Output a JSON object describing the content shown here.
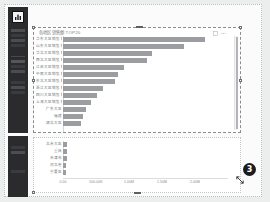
{
  "app": {
    "logo_icon": "bar-chart-logo-icon",
    "sidebar": {
      "items": [
        {
          "icon": "grid-menu-icon"
        },
        {
          "icon": "grid-menu-icon"
        },
        {
          "icon": "list-menu-icon"
        },
        {
          "icon": "list-menu-icon"
        },
        {
          "icon": "settings-menu-icon"
        },
        {
          "icon": "settings-menu-icon"
        }
      ]
    }
  },
  "panels": {
    "top": {
      "title": "各地区销售额 TOP20",
      "selected": true,
      "tools": [
        {
          "icon": "expand-icon"
        },
        {
          "icon": "more-options-icon"
        }
      ],
      "scrollbar": {
        "icon": "vertical-scrollbar"
      }
    },
    "bottom": {
      "annotation_badge": "3",
      "cursor_icon": "resize-diagonal-cursor"
    }
  },
  "chart_data": {
    "type": "bar",
    "orientation": "horizontal",
    "title": "各地区销售额 TOP20",
    "xlabel": "",
    "ylabel": "",
    "grid": false,
    "legend": null,
    "xlim": [
      0,
      2500000
    ],
    "xticks": [
      "0.00",
      "500.00K",
      "1.00M",
      "1.50M",
      "2.00M"
    ],
    "xtick_values": [
      0,
      500000,
      1000000,
      1500000,
      2000000
    ],
    "categories": [
      "华东大区销售额",
      "山东大区销售额",
      "华北大区销售额",
      "西北大区销售额",
      "江苏大区销售额",
      "中南大区销售额",
      "东北大区销售额",
      "浙江大区销售额",
      "四川大区销售额",
      "上海大区销售额",
      "广东大区",
      "福建",
      "湖北大区",
      "北京大区",
      "重庆",
      "天津市",
      "河北省",
      "宁夏区"
    ],
    "values": [
      2180000,
      1860000,
      1360000,
      1290000,
      930000,
      850000,
      790000,
      610000,
      520000,
      430000,
      360000,
      300000,
      270000,
      60000,
      58000,
      55000,
      52000,
      50000
    ]
  }
}
